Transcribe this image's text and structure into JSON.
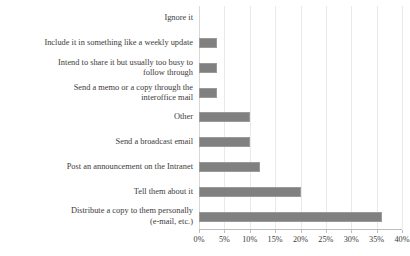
{
  "chart_data": {
    "type": "bar",
    "orientation": "horizontal",
    "title": "",
    "subtitle": "",
    "xlabel": "",
    "ylabel": "",
    "categories": [
      "Ignore it",
      "Include it in something like a weekly update",
      "Intend to share it but usually too busy to\nfollow through",
      "Send a memo or a copy through the\ninteroffice mail",
      "Other",
      "Send a broadcast email",
      "Post an announcement on the Intranet",
      "Tell them about it",
      "Distribute a copy to them personally\n(e-mail, etc.)"
    ],
    "values": [
      0,
      3.5,
      3.5,
      3.5,
      10,
      10,
      12,
      20,
      36
    ],
    "value_unit": "%",
    "xlim": [
      0,
      40
    ],
    "xticks": [
      0,
      5,
      10,
      15,
      20,
      25,
      30,
      35,
      40
    ],
    "xticklabels": [
      "0%",
      "5%",
      "10%",
      "15%",
      "20%",
      "25%",
      "30%",
      "35%",
      "40%"
    ],
    "grid": true,
    "grid_axis": "x",
    "legend": false,
    "legend_position": "none",
    "bar_color": "#808080",
    "bar_edge_color": "#9a9a9a",
    "gridline_color": "#e9e9e9",
    "text_color": "#3b3b3b"
  }
}
